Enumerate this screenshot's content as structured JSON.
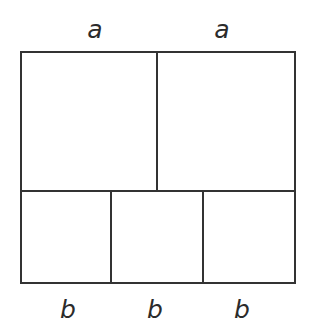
{
  "figure": {
    "background_color": "#ffffff",
    "line_color": "#333333",
    "label_color": "#2b2b2b",
    "line_width_px": 2,
    "outer_rect": {
      "left": 20,
      "top": 51,
      "right": 294,
      "bottom": 283,
      "width": 274,
      "height": 232
    },
    "dividers": {
      "horizontal": [
        191
      ],
      "top_row_vertical": [
        157
      ],
      "bottom_row_vertical": [
        110,
        203
      ]
    },
    "top_labels": [
      {
        "text": "a",
        "x": 95,
        "y": 30
      },
      {
        "text": "a",
        "x": 222,
        "y": 30
      }
    ],
    "bottom_labels": [
      {
        "text": "b",
        "x": 68,
        "y": 310
      },
      {
        "text": "b",
        "x": 155,
        "y": 310
      },
      {
        "text": "b",
        "x": 242,
        "y": 310
      }
    ]
  }
}
